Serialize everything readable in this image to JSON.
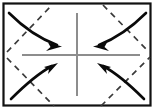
{
  "figure": {
    "background_color": "#ffffff",
    "canvas": {
      "width": 157,
      "height": 110
    }
  },
  "frame": {
    "name": "outer-frame",
    "x": 3.5,
    "y": 3.5,
    "width": 147,
    "height": 102,
    "stroke_color": "#111111",
    "stroke_width": 2.2,
    "fill_color": "#ffffff"
  },
  "axes": {
    "stroke_color": "#8d8d8d",
    "stroke_width": 2.0,
    "center": {
      "x": 77,
      "y": 55
    },
    "vertical": {
      "x": 77,
      "y1": 13,
      "y2": 96
    },
    "horizontal": {
      "y": 55,
      "x1": 22,
      "x2": 140
    }
  },
  "dashed_lines": {
    "stroke_color": "#3a3a3a",
    "stroke_width": 1.7,
    "dash_pattern": "6 5",
    "segments": [
      {
        "name": "dashed-top-left",
        "x1": 7,
        "y1": 52,
        "x2": 52,
        "y2": 5
      },
      {
        "name": "dashed-top-right",
        "x1": 103,
        "y1": 5,
        "x2": 149,
        "y2": 52
      },
      {
        "name": "dashed-bottom-left",
        "x1": 7,
        "y1": 58,
        "x2": 54,
        "y2": 106
      },
      {
        "name": "dashed-bottom-right",
        "x1": 101,
        "y1": 106,
        "x2": 150,
        "y2": 57
      }
    ]
  },
  "arrows": {
    "stroke_color": "#0a0a0a",
    "stroke_width": 2.6,
    "items": [
      {
        "name": "arrow-top-left",
        "direction": "down-right",
        "path": "M 9,13 C 22,26 38,38 57,45",
        "head_points": "62,46.5 48,42.5 50.5,47 46,51",
        "start": {
          "x": 9,
          "y": 13
        },
        "end": {
          "x": 62,
          "y": 46.5
        }
      },
      {
        "name": "arrow-top-right",
        "direction": "down-left",
        "path": "M 146,13 C 133,26 117,38 99,45",
        "head_points": "93,46.5 107,42.5 104.5,47 109,51",
        "start": {
          "x": 146,
          "y": 13
        },
        "end": {
          "x": 93,
          "y": 46.5
        }
      },
      {
        "name": "arrow-bottom-left",
        "direction": "up-right",
        "path": "M 11,99 C 23,87 37,74 52,66",
        "head_points": "58,63 44,67 49,69.5 48,74",
        "start": {
          "x": 11,
          "y": 99
        },
        "end": {
          "x": 58,
          "y": 63
        }
      },
      {
        "name": "arrow-bottom-right",
        "direction": "up-left",
        "path": "M 144,99 C 132,87 118,74 103,66",
        "head_points": "97,63 111,67 106,69.5 107,74",
        "start": {
          "x": 144,
          "y": 99
        },
        "end": {
          "x": 97,
          "y": 63
        }
      }
    ]
  }
}
